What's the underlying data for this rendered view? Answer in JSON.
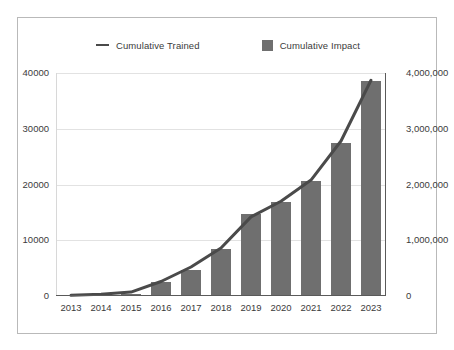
{
  "chart_data": {
    "type": "bar",
    "title": "",
    "subtitle": "",
    "xlabel": "",
    "ylabel": "",
    "grid": true,
    "legend_position": "top-center",
    "categories": [
      "2013",
      "2014",
      "2015",
      "2016",
      "2017",
      "2018",
      "2019",
      "2020",
      "2021",
      "2022",
      "2023"
    ],
    "axes": {
      "left": {
        "label": "",
        "ylim": [
          0,
          40000
        ],
        "ticks": [
          0,
          10000,
          20000,
          30000,
          40000
        ],
        "tick_labels": [
          "0",
          "10000",
          "20000",
          "30000",
          "40000"
        ]
      },
      "right": {
        "label": "",
        "ylim": [
          0,
          4000000
        ],
        "ticks": [
          0,
          1000000,
          2000000,
          3000000,
          4000000
        ],
        "tick_labels": [
          "0",
          "1,000,000",
          "2,000,000",
          "3,000,000",
          "4,000,000"
        ]
      }
    },
    "series": [
      {
        "name": "Cumulative Trained",
        "type": "line",
        "axis": "left",
        "color": "#4a4a4a",
        "values": [
          120,
          300,
          700,
          2600,
          5200,
          8600,
          14200,
          17000,
          20800,
          27800,
          38700
        ]
      },
      {
        "name": "Cumulative Impact",
        "type": "bar",
        "axis": "right",
        "color": "#6f6f6f",
        "values": [
          5000,
          20000,
          40000,
          250000,
          470000,
          850000,
          1480000,
          1680000,
          2070000,
          2750000,
          3850000
        ]
      }
    ]
  },
  "legend": {
    "items": [
      {
        "label": "Cumulative Trained",
        "marker": "line",
        "color": "#4a4a4a"
      },
      {
        "label": "Cumulative Impact",
        "marker": "square",
        "color": "#6f6f6f"
      }
    ]
  },
  "colors": {
    "bar": "#6f6f6f",
    "line": "#4a4a4a",
    "grid": "#e2e2e2",
    "axis": "#5a5a5a",
    "frame": "#b9b9b9",
    "text": "#3b3b3b",
    "background": "#ffffff"
  }
}
